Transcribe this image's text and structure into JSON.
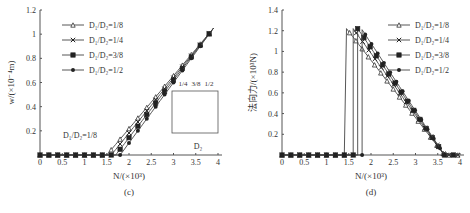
{
  "note": "Data values are approximate estimates read from a low-resolution screenshot, not exact digitized points.",
  "chart_data": [
    {
      "id": "c",
      "type": "line",
      "caption": "(c)",
      "xlabel": "N/(×10³)",
      "ylabel": "w/(×10⁻⁴m)",
      "xlim": [
        0,
        4
      ],
      "ylim": [
        0,
        1.2
      ],
      "xticks": [
        "0",
        "0.5",
        "1",
        "1.5",
        "2",
        "2.5",
        "3",
        "3.5",
        "4"
      ],
      "yticks": [
        "0.2",
        "0.4",
        "0.6",
        "0.8",
        "1",
        "1.2"
      ],
      "legend": [
        "D₁/D₂=1/8",
        "D₁/D₂=1/4",
        "D₁/D₂=3/8",
        "D₁/D₂=1/2"
      ],
      "legend_markers": [
        "triangle",
        "cross",
        "square",
        "diamond"
      ],
      "annotation": "D₁/D₂=1/8",
      "inset": {
        "labels": [
          "1/4",
          "3/8",
          "1/2"
        ],
        "dimension": "D₂"
      },
      "series": [
        {
          "name": "D₁/D₂=1/8",
          "marker": "triangle",
          "onset": 1.5,
          "end": [
            3.9,
            1.05
          ]
        },
        {
          "name": "D₁/D₂=1/4",
          "marker": "cross",
          "onset": 1.6,
          "end": [
            3.9,
            1.05
          ]
        },
        {
          "name": "D₁/D₂=3/8",
          "marker": "square",
          "onset": 1.7,
          "end": [
            3.9,
            1.05
          ]
        },
        {
          "name": "D₁/D₂=1/2",
          "marker": "diamond",
          "onset": 1.8,
          "end": [
            3.9,
            1.05
          ]
        }
      ]
    },
    {
      "id": "d",
      "type": "line",
      "caption": "(d)",
      "xlabel": "N/(×10³)",
      "ylabel": "法向力/(×10³N)",
      "xlim": [
        0,
        4
      ],
      "ylim": [
        0,
        1.4
      ],
      "xticks": [
        "0",
        "0.5",
        "1",
        "1.5",
        "2",
        "2.5",
        "3",
        "3.5",
        "4"
      ],
      "yticks": [
        "0.2",
        "0.4",
        "0.6",
        "0.8",
        "1",
        "1.2",
        "1.4"
      ],
      "legend": [
        "D₁/D₂=1/8",
        "D₁/D₂=1/4",
        "D₁/D₂=3/8",
        "D₁/D₂=1/2"
      ],
      "legend_markers": [
        "triangle",
        "cross",
        "square",
        "diamond"
      ],
      "series": [
        {
          "name": "D₁/D₂=1/8",
          "marker": "triangle",
          "jump_at": 1.45,
          "peak": 1.22,
          "zero_at": 3.65
        },
        {
          "name": "D₁/D₂=1/4",
          "marker": "cross",
          "jump_at": 1.6,
          "peak": 1.22,
          "zero_at": 3.65
        },
        {
          "name": "D₁/D₂=3/8",
          "marker": "square",
          "jump_at": 1.7,
          "peak": 1.22,
          "zero_at": 3.65
        },
        {
          "name": "D₁/D₂=1/2",
          "marker": "diamond",
          "jump_at": 1.8,
          "peak": 1.21,
          "zero_at": 3.65
        }
      ]
    }
  ]
}
